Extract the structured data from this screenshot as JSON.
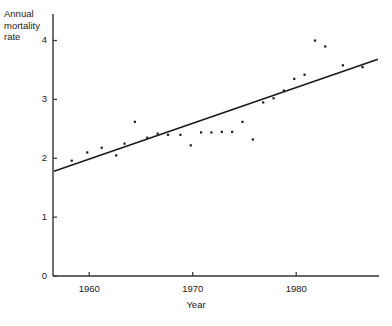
{
  "chart_data": {
    "type": "scatter",
    "title": "",
    "subtitle": "",
    "xlabel": "Year",
    "ylabel": "Annual\nmortality\nrate",
    "ylabel_lines": [
      "Annual",
      "mortality",
      "rate"
    ],
    "xlim": [
      1956.5,
      1988
    ],
    "ylim": [
      0,
      4.45
    ],
    "xticks": [
      1960,
      1970,
      1980
    ],
    "xtick_labels": [
      "1960",
      "1970",
      "1980"
    ],
    "yticks": [
      0,
      1,
      2,
      3,
      4
    ],
    "ytick_labels": [
      "0",
      "1",
      "2",
      "3",
      "4"
    ],
    "grid": false,
    "legend": null,
    "legend_position": "none",
    "marker_color": "#1a1a1a",
    "line_color": "#1a1a1a",
    "axis_color": "#333333",
    "background": "#ffffff",
    "series": [
      {
        "name": "Annual mortality rate",
        "type": "scatter",
        "x": [
          1958.3,
          1959.8,
          1961.2,
          1962.6,
          1963.4,
          1964.4,
          1965.6,
          1966.6,
          1967.6,
          1968.8,
          1969.8,
          1970.8,
          1971.8,
          1972.8,
          1973.8,
          1974.8,
          1975.8,
          1976.8,
          1977.8,
          1978.8,
          1979.8,
          1980.8,
          1981.8,
          1982.8,
          1984.5,
          1986.4
        ],
        "y": [
          1.96,
          2.1,
          2.18,
          2.05,
          2.25,
          2.62,
          2.35,
          2.42,
          2.4,
          2.4,
          2.22,
          2.44,
          2.44,
          2.45,
          2.45,
          2.62,
          2.32,
          2.95,
          3.02,
          3.15,
          3.35,
          3.42,
          4.0,
          3.9,
          3.58,
          3.55
        ]
      },
      {
        "name": "fitted regression line",
        "type": "line",
        "x": [
          1956.6,
          1987.9
        ],
        "y": [
          1.78,
          3.68
        ]
      }
    ]
  }
}
